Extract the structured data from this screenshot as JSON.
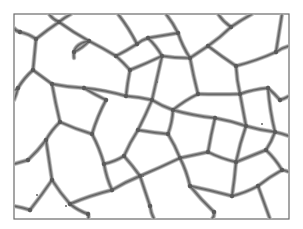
{
  "image": {
    "description": "Grayscale micrograph of a cellular / foam-like network of thin walls enclosing polygonal cells",
    "width": 303,
    "height": 229,
    "frame": {
      "x": 14,
      "y": 14,
      "w": 275,
      "h": 205
    },
    "colors": {
      "background": "#ffffff",
      "frame": "#6a6a6a",
      "wall": "#8a8a8a",
      "wall_core": "#5e5e5e",
      "halo": "#c9c9c9"
    }
  },
  "network": {
    "nodes": {
      "a": [
        59,
        22
      ],
      "b": [
        36,
        39
      ],
      "c": [
        20,
        32
      ],
      "d": [
        89,
        41
      ],
      "e": [
        74,
        52
      ],
      "f": [
        33,
        70
      ],
      "g": [
        18,
        88
      ],
      "h": [
        52,
        84
      ],
      "i": [
        84,
        88
      ],
      "j": [
        116,
        56
      ],
      "k": [
        137,
        44
      ],
      "l": [
        148,
        38
      ],
      "m": [
        162,
        56
      ],
      "n": [
        130,
        70
      ],
      "o": [
        178,
        33
      ],
      "p": [
        190,
        58
      ],
      "q": [
        208,
        46
      ],
      "r": [
        231,
        27
      ],
      "s": [
        236,
        66
      ],
      "t": [
        276,
        52
      ],
      "u": [
        268,
        88
      ],
      "v": [
        240,
        94
      ],
      "w": [
        280,
        100
      ],
      "x": [
        126,
        96
      ],
      "y": [
        106,
        100
      ],
      "z": [
        152,
        100
      ],
      "aa": [
        173,
        110
      ],
      "ab": [
        198,
        94
      ],
      "ac": [
        215,
        118
      ],
      "ad": [
        246,
        126
      ],
      "ae": [
        275,
        132
      ],
      "af": [
        208,
        152
      ],
      "ag": [
        236,
        162
      ],
      "ah": [
        266,
        150
      ],
      "ai": [
        282,
        170
      ],
      "aj": [
        92,
        134
      ],
      "ak": [
        60,
        122
      ],
      "al": [
        46,
        140
      ],
      "am": [
        28,
        160
      ],
      "an": [
        104,
        164
      ],
      "ao": [
        138,
        130
      ],
      "ap": [
        168,
        134
      ],
      "aq": [
        180,
        158
      ],
      "ar": [
        140,
        176
      ],
      "as": [
        112,
        190
      ],
      "at": [
        52,
        180
      ],
      "au": [
        70,
        204
      ],
      "av": [
        150,
        206
      ],
      "aw": [
        190,
        186
      ],
      "ax": [
        232,
        196
      ],
      "ay": [
        258,
        186
      ],
      "az": [
        214,
        212
      ],
      "ba": [
        30,
        210
      ],
      "bb": [
        88,
        214
      ],
      "bc": [
        124,
        156
      ]
    },
    "edges": [
      [
        "a",
        [
          49,
          14
        ]
      ],
      [
        "a",
        [
          71,
          14
        ]
      ],
      [
        "a",
        "b"
      ],
      [
        "b",
        "c"
      ],
      [
        "c",
        [
          14,
          28
        ]
      ],
      [
        "b",
        "f"
      ],
      [
        "a",
        "d"
      ],
      [
        "d",
        "e"
      ],
      [
        "d",
        "j"
      ],
      [
        "j",
        "k"
      ],
      [
        "k",
        [
          118,
          14
        ]
      ],
      [
        "k",
        "l"
      ],
      [
        "l",
        "o"
      ],
      [
        "o",
        [
          166,
          14
        ]
      ],
      [
        "l",
        "m"
      ],
      [
        "m",
        "n"
      ],
      [
        "n",
        "j"
      ],
      [
        "o",
        "p"
      ],
      [
        "p",
        "m"
      ],
      [
        "p",
        "q"
      ],
      [
        "q",
        "r"
      ],
      [
        "r",
        [
          218,
          14
        ]
      ],
      [
        "r",
        [
          252,
          14
        ]
      ],
      [
        "q",
        "s"
      ],
      [
        "s",
        "t"
      ],
      [
        "t",
        [
          289,
          46
        ]
      ],
      [
        "t",
        [
          282,
          14
        ]
      ],
      [
        "s",
        "v"
      ],
      [
        "v",
        "u"
      ],
      [
        "u",
        "w"
      ],
      [
        "w",
        [
          289,
          96
        ]
      ],
      [
        "f",
        "g"
      ],
      [
        "g",
        [
          14,
          90
        ]
      ],
      [
        "f",
        "h"
      ],
      [
        "h",
        "i"
      ],
      [
        "i",
        "x"
      ],
      [
        "x",
        "n"
      ],
      [
        "i",
        "y"
      ],
      [
        "y",
        "aj"
      ],
      [
        "x",
        "z"
      ],
      [
        "z",
        "m"
      ],
      [
        "z",
        "aa"
      ],
      [
        "aa",
        "ab"
      ],
      [
        "ab",
        "p"
      ],
      [
        "ab",
        "v"
      ],
      [
        "aa",
        "ac"
      ],
      [
        "ac",
        "ad"
      ],
      [
        "ad",
        "v"
      ],
      [
        "ad",
        "ae"
      ],
      [
        "ae",
        "u"
      ],
      [
        "ae",
        [
          289,
          136
        ]
      ],
      [
        "ac",
        "af"
      ],
      [
        "af",
        "ag"
      ],
      [
        "ag",
        "ad"
      ],
      [
        "ag",
        "ah"
      ],
      [
        "ah",
        "ae"
      ],
      [
        "ah",
        "ai"
      ],
      [
        "ai",
        [
          289,
          172
        ]
      ],
      [
        "h",
        "ak"
      ],
      [
        "ak",
        "al"
      ],
      [
        "al",
        "am"
      ],
      [
        "am",
        [
          14,
          164
        ]
      ],
      [
        "ak",
        "aj"
      ],
      [
        "aj",
        "an"
      ],
      [
        "z",
        "ao"
      ],
      [
        "ao",
        "ap"
      ],
      [
        "ap",
        "aa"
      ],
      [
        "ap",
        "aq"
      ],
      [
        "aq",
        "af"
      ],
      [
        "ao",
        "bc"
      ],
      [
        "bc",
        "an"
      ],
      [
        "bc",
        "ar"
      ],
      [
        "ar",
        "aq"
      ],
      [
        "an",
        "as"
      ],
      [
        "as",
        "ar"
      ],
      [
        "al",
        "at"
      ],
      [
        "at",
        "au"
      ],
      [
        "au",
        "as"
      ],
      [
        "at",
        "ba"
      ],
      [
        "ba",
        [
          14,
          206
        ]
      ],
      [
        "au",
        "bb"
      ],
      [
        "bb",
        [
          88,
          219
        ]
      ],
      [
        "ar",
        "av"
      ],
      [
        "av",
        [
          154,
          219
        ]
      ],
      [
        "aq",
        "aw"
      ],
      [
        "aw",
        "ax"
      ],
      [
        "ax",
        "ag"
      ],
      [
        "ax",
        "ay"
      ],
      [
        "ay",
        "ai"
      ],
      [
        "ay",
        [
          270,
          219
        ]
      ],
      [
        "aw",
        "az"
      ],
      [
        "az",
        [
          212,
          219
        ]
      ],
      [
        "g",
        [
          14,
          100
        ]
      ]
    ],
    "stubs": [
      {
        "from": [
          89,
          41
        ],
        "path": "M89,41 Q72,44 74,58"
      },
      {
        "from": [
          20,
          32
        ],
        "path": "M20,32 L14,30"
      }
    ],
    "specks": [
      [
        157,
        82
      ],
      [
        66,
        206
      ],
      [
        143,
        176
      ],
      [
        262,
        124
      ],
      [
        37,
        195
      ]
    ]
  }
}
